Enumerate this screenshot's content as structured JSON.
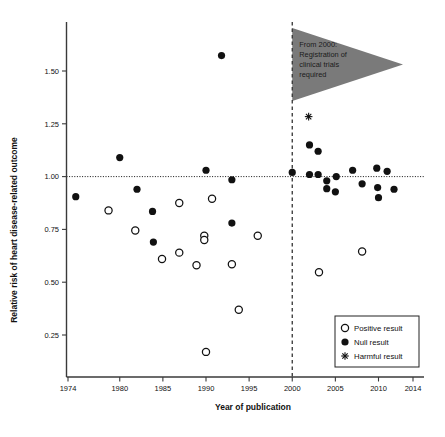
{
  "chart_data": {
    "type": "scatter",
    "title": "",
    "xlabel": "Year of publication",
    "ylabel": "Relative risk of heart disease-related outcome",
    "xlim": [
      1974,
      2014
    ],
    "ylim": [
      0.1,
      1.65
    ],
    "xticks": [
      1974,
      1980,
      1985,
      1990,
      1995,
      2000,
      2005,
      2010,
      2014
    ],
    "xtick_labels": [
      "1974",
      "1980",
      "1985",
      "1990",
      "1995",
      "2000",
      "2005",
      "2010",
      "2014"
    ],
    "yticks": [
      0.25,
      0.5,
      0.75,
      1.0,
      1.25,
      1.5
    ],
    "ytick_labels": [
      "0.25",
      "0.50",
      "0.75",
      "1.00",
      "1.25",
      "1.50"
    ],
    "grid": false,
    "reference_line_y": 1.0,
    "reference_line_x": 2000,
    "legend_position": "bottom-right",
    "series": [
      {
        "name": "Positive result",
        "marker": "open-circle",
        "color": "#ffffff",
        "edge_color": "#111111",
        "points": [
          {
            "x": 1978.7,
            "y": 0.84
          },
          {
            "x": 1981.8,
            "y": 0.745
          },
          {
            "x": 1984.9,
            "y": 0.61
          },
          {
            "x": 1986.9,
            "y": 0.875
          },
          {
            "x": 1986.9,
            "y": 0.64
          },
          {
            "x": 1988.9,
            "y": 0.58
          },
          {
            "x": 1989.8,
            "y": 0.72
          },
          {
            "x": 1989.8,
            "y": 0.7
          },
          {
            "x": 1990.0,
            "y": 0.17
          },
          {
            "x": 1990.7,
            "y": 0.895
          },
          {
            "x": 1993.0,
            "y": 0.585
          },
          {
            "x": 1993.8,
            "y": 0.37
          },
          {
            "x": 1996.0,
            "y": 0.72
          },
          {
            "x": 2003.1,
            "y": 0.547
          },
          {
            "x": 2008.1,
            "y": 0.645
          }
        ]
      },
      {
        "name": "Null result",
        "marker": "filled-circle",
        "color": "#111111",
        "points": [
          {
            "x": 1974.9,
            "y": 0.905
          },
          {
            "x": 1980.0,
            "y": 1.09
          },
          {
            "x": 1982.0,
            "y": 0.94
          },
          {
            "x": 1983.8,
            "y": 0.835
          },
          {
            "x": 1983.9,
            "y": 0.69
          },
          {
            "x": 1990.0,
            "y": 1.03
          },
          {
            "x": 1991.8,
            "y": 1.573
          },
          {
            "x": 1993.0,
            "y": 0.985
          },
          {
            "x": 1993.0,
            "y": 0.78
          },
          {
            "x": 2000.0,
            "y": 1.02
          },
          {
            "x": 2002.0,
            "y": 1.15
          },
          {
            "x": 2002.0,
            "y": 1.01
          },
          {
            "x": 2003.0,
            "y": 1.12
          },
          {
            "x": 2003.0,
            "y": 1.01
          },
          {
            "x": 2004.0,
            "y": 0.98
          },
          {
            "x": 2004.0,
            "y": 0.943
          },
          {
            "x": 2005.0,
            "y": 0.928
          },
          {
            "x": 2005.1,
            "y": 1.0
          },
          {
            "x": 2007.0,
            "y": 1.03
          },
          {
            "x": 2008.1,
            "y": 0.966
          },
          {
            "x": 2009.8,
            "y": 1.04
          },
          {
            "x": 2009.9,
            "y": 0.948
          },
          {
            "x": 2010.0,
            "y": 0.9
          },
          {
            "x": 2011.0,
            "y": 1.025
          },
          {
            "x": 2011.8,
            "y": 0.94
          }
        ]
      },
      {
        "name": "Harmful result",
        "marker": "asterisk",
        "color": "#111111",
        "points": [
          {
            "x": 2001.9,
            "y": 1.284
          }
        ]
      }
    ],
    "annotation": {
      "shape": "triangle",
      "color": "#7a7a7a",
      "lines": [
        "From 2000:",
        "Registration of",
        "clinical trials",
        "required"
      ]
    },
    "legend": [
      {
        "label": "Positive result",
        "marker": "open-circle"
      },
      {
        "label": "Null result",
        "marker": "filled-circle"
      },
      {
        "label": "Harmful result",
        "marker": "asterisk"
      }
    ]
  }
}
